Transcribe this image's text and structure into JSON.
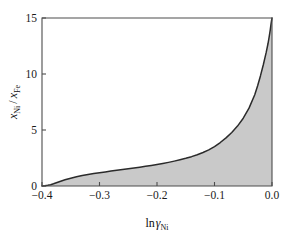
{
  "chart_data": {
    "type": "area",
    "title": "",
    "xlabel": "ln γ_Ni",
    "ylabel": "x_Ni / x_Fe",
    "xlim": [
      -0.4,
      0.0
    ],
    "ylim": [
      0,
      15
    ],
    "grid": false,
    "legend": null,
    "fill_color": "#c9c9c9",
    "line_color": "#2b2b2b",
    "frame_color": "#4d4d4d",
    "x": [
      -0.4,
      -0.395,
      -0.39,
      -0.385,
      -0.38,
      -0.375,
      -0.37,
      -0.365,
      -0.36,
      -0.35,
      -0.34,
      -0.33,
      -0.32,
      -0.31,
      -0.3,
      -0.29,
      -0.28,
      -0.27,
      -0.26,
      -0.25,
      -0.24,
      -0.23,
      -0.22,
      -0.21,
      -0.2,
      -0.19,
      -0.18,
      -0.17,
      -0.16,
      -0.15,
      -0.14,
      -0.13,
      -0.12,
      -0.11,
      -0.1,
      -0.09,
      -0.08,
      -0.07,
      -0.06,
      -0.05,
      -0.04,
      -0.03,
      -0.025,
      -0.02,
      -0.015,
      -0.01,
      -0.007,
      -0.005,
      -0.003,
      -0.002,
      -0.001,
      0.0
    ],
    "y": [
      0.0,
      0.02,
      0.06,
      0.12,
      0.2,
      0.29,
      0.38,
      0.47,
      0.55,
      0.7,
      0.83,
      0.94,
      1.03,
      1.11,
      1.19,
      1.26,
      1.33,
      1.4,
      1.47,
      1.54,
      1.61,
      1.68,
      1.76,
      1.84,
      1.92,
      2.01,
      2.11,
      2.22,
      2.34,
      2.47,
      2.62,
      2.79,
      2.99,
      3.22,
      3.52,
      3.88,
      4.3,
      4.78,
      5.35,
      6.05,
      6.95,
      8.15,
      8.95,
      9.85,
      10.85,
      11.95,
      12.7,
      13.3,
      13.95,
      14.35,
      14.7,
      15.0
    ],
    "x_ticks": [
      -0.4,
      -0.3,
      -0.2,
      -0.1,
      0.0
    ],
    "x_tick_labels": [
      "−0.4",
      "−0.3",
      "−0.2",
      "−0.1",
      "0.0"
    ],
    "y_ticks": [
      0,
      5,
      10,
      15
    ],
    "y_tick_labels": [
      "0",
      "5",
      "10",
      "15"
    ],
    "annotations": []
  },
  "axes": {
    "xlabel_parts": {
      "prefix": "ln",
      "symbol": "γ",
      "subscript": "Ni"
    },
    "ylabel_parts": {
      "numerator_symbol": "x",
      "numerator_subscript": "Ni",
      "separator": "/",
      "denominator_symbol": "x",
      "denominator_subscript": "Fe"
    }
  }
}
